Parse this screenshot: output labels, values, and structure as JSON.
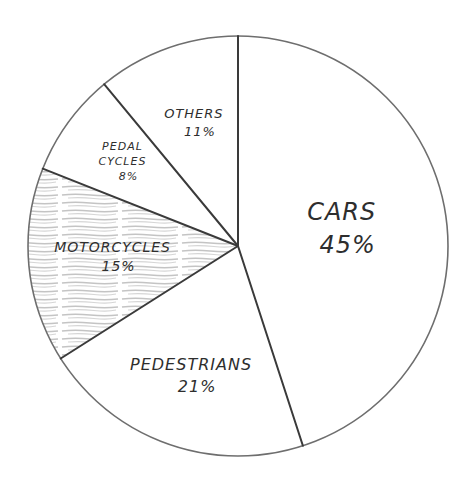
{
  "chart_data": {
    "type": "pie",
    "title": "",
    "style": "hand-drawn pencil sketch",
    "categories": [
      "CARS",
      "PEDESTRIANS",
      "MOTORCYCLES",
      "PEDAL CYCLES",
      "OTHERS"
    ],
    "values": [
      45,
      21,
      15,
      8,
      11
    ],
    "value_labels": [
      "45%",
      "21%",
      "15%",
      "8%",
      "11%"
    ],
    "start_angle_deg": 0,
    "direction": "clockwise",
    "shaded_slices": [
      "MOTORCYCLES"
    ],
    "legend": "none (labels drawn inside slices)",
    "slices": [
      {
        "label": "CARS",
        "value": 45,
        "pct_text": "45%"
      },
      {
        "label": "PEDESTRIANS",
        "value": 21,
        "pct_text": "21%"
      },
      {
        "label": "MOTORCYCLES",
        "value": 15,
        "pct_text": "15%"
      },
      {
        "label": "PEDAL CYCLES",
        "label_lines": [
          "PEDAL",
          "CYCLES"
        ],
        "value": 8,
        "pct_text": "8%"
      },
      {
        "label": "OTHERS",
        "value": 11,
        "pct_text": "11%"
      }
    ]
  },
  "colors": {
    "background": "#ffffff",
    "outline": "#6e6e6e",
    "divider": "#3a3a3a",
    "text": "#2e2e2e",
    "shade": "#bdbdbd"
  }
}
